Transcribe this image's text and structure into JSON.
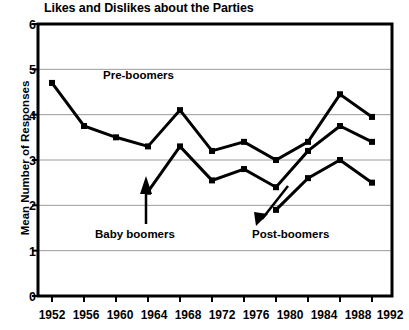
{
  "chart_data": {
    "type": "line",
    "title": "Likes and Dislikes about the Parties",
    "xlabel": "",
    "ylabel": "Mean Number of Responses",
    "ylim": [
      0,
      6
    ],
    "yticks": [
      "0",
      "1",
      "2",
      "3",
      "4",
      "5",
      "6"
    ],
    "grid": "horizontal",
    "legend_position": "inline-annotations",
    "categories": [
      "1952",
      "1956",
      "1960",
      "1964",
      "1968",
      "1972",
      "1976",
      "1980",
      "1984",
      "1988",
      "1992"
    ],
    "series": [
      {
        "name": "Pre-boomers",
        "x": [
          "1952",
          "1956",
          "1960",
          "1964",
          "1968",
          "1972",
          "1976",
          "1980",
          "1984",
          "1988",
          "1992"
        ],
        "values": [
          4.7,
          3.75,
          3.5,
          3.3,
          4.1,
          3.2,
          3.4,
          3.0,
          3.4,
          4.45,
          3.95
        ]
      },
      {
        "name": "Baby boomers",
        "x": [
          "1964",
          "1968",
          "1972",
          "1976",
          "1980",
          "1984",
          "1988",
          "1992"
        ],
        "values": [
          2.3,
          3.3,
          2.55,
          2.8,
          2.4,
          3.2,
          3.75,
          3.4
        ]
      },
      {
        "name": "Post-boomers",
        "x": [
          "1980",
          "1984",
          "1988",
          "1992"
        ],
        "values": [
          1.9,
          2.6,
          3.0,
          2.5
        ]
      }
    ],
    "annotations": [
      {
        "text": "Pre-boomers",
        "x": 1962,
        "y": 4.45
      },
      {
        "text": "Baby boomers",
        "x": 1961,
        "y": 1.55
      },
      {
        "text": "Post-boomers",
        "x": 1981,
        "y": 1.55
      }
    ]
  },
  "colors": {
    "line": "#000000",
    "grid": "#9a9a9a",
    "frame": "#000000",
    "background": "#ffffff"
  }
}
